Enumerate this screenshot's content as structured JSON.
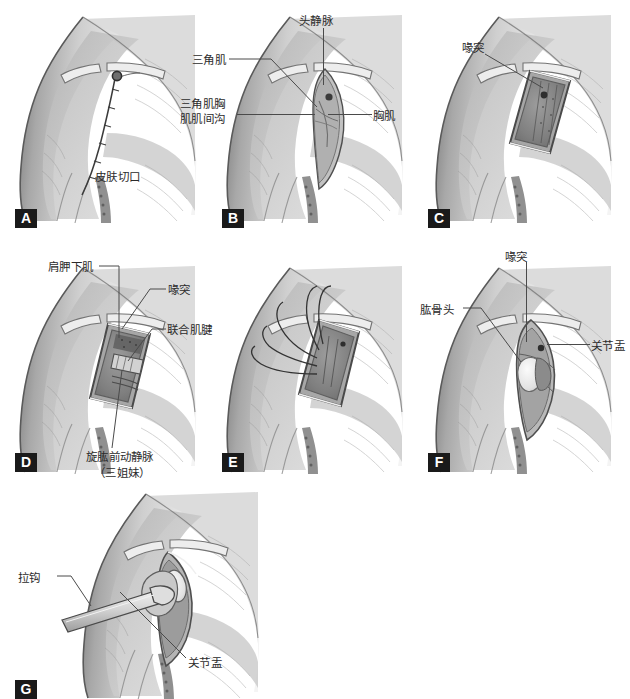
{
  "document": {
    "type": "medical-surgical-illustration",
    "subject": "Deltopectoral approach to the shoulder — step sequence",
    "panel_count": 7,
    "palette": {
      "background": "#ffffff",
      "ink": "#2b2b2b",
      "leader_line": "#4a4a4a",
      "panel_tag_bg": "#1a1a1a",
      "panel_tag_fg": "#ffffff",
      "skin_light": "#e3e3e3",
      "skin_mid": "#c6c6c6",
      "skin_dark": "#9a9a9a",
      "shadow": "#6e6e6e",
      "outline": "#5c5c5c",
      "wound_deep": "#7d7d7d",
      "bone": "#efefef"
    }
  },
  "panels": [
    {
      "tag": "A",
      "labels": [
        {
          "text": "皮肤切口"
        }
      ],
      "caption": ""
    },
    {
      "tag": "B",
      "labels": [
        {
          "text": "头静脉"
        },
        {
          "text": "三角肌"
        },
        {
          "text": "三角肌胸肌肌间沟"
        },
        {
          "text": "胸肌"
        }
      ],
      "caption": ""
    },
    {
      "tag": "C",
      "labels": [
        {
          "text": "喙突"
        }
      ],
      "caption": ""
    },
    {
      "tag": "D",
      "labels": [
        {
          "text": "肩胛下肌"
        },
        {
          "text": "喙突"
        },
        {
          "text": "联合肌腱"
        },
        {
          "text": "旋肱前动静脉"
        },
        {
          "text": "（三姐妹）"
        }
      ],
      "caption": ""
    },
    {
      "tag": "E",
      "labels": [],
      "caption": "剥离肩胛下肌"
    },
    {
      "tag": "F",
      "labels": [
        {
          "text": "喙突"
        },
        {
          "text": "肱骨头"
        },
        {
          "text": "关节盂"
        }
      ],
      "caption": ""
    },
    {
      "tag": "G",
      "labels": [
        {
          "text": "拉钩"
        },
        {
          "text": "关节盂"
        }
      ],
      "caption": ""
    }
  ]
}
